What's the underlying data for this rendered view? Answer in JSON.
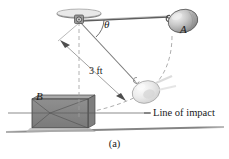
{
  "figure": {
    "caption": "(a)",
    "labels": {
      "ball_a": "A",
      "block_b": "B",
      "angle": "θ",
      "cord_length": "3 ft",
      "line_of_impact": "Line of impact"
    },
    "icons": {
      "ceiling_mount": "ceiling-pivot-icon",
      "ball_raised": "ball-a-raised-icon",
      "ball_lowest": "ball-a-lowest-icon",
      "block": "block-b-icon",
      "ground": "ground-line-icon",
      "trajectory": "dashed-swing-arc-icon",
      "dimension_arrow": "dimension-arrow-icon"
    },
    "colors": {
      "stroke": "#3b3b3b",
      "block_fill": "#8b8b8b",
      "block_top": "#a8a8a8",
      "ball_fill": "#b9b9b9",
      "ball_ghost": "#e2e2e2",
      "ground": "#9a9a9a",
      "dashed": "#9e9e9e",
      "text": "#1a1a1a"
    },
    "geometry": {
      "pivot_x": 79,
      "pivot_y": 20,
      "cord_length_label": "3 ft",
      "angle_label": "θ"
    }
  }
}
